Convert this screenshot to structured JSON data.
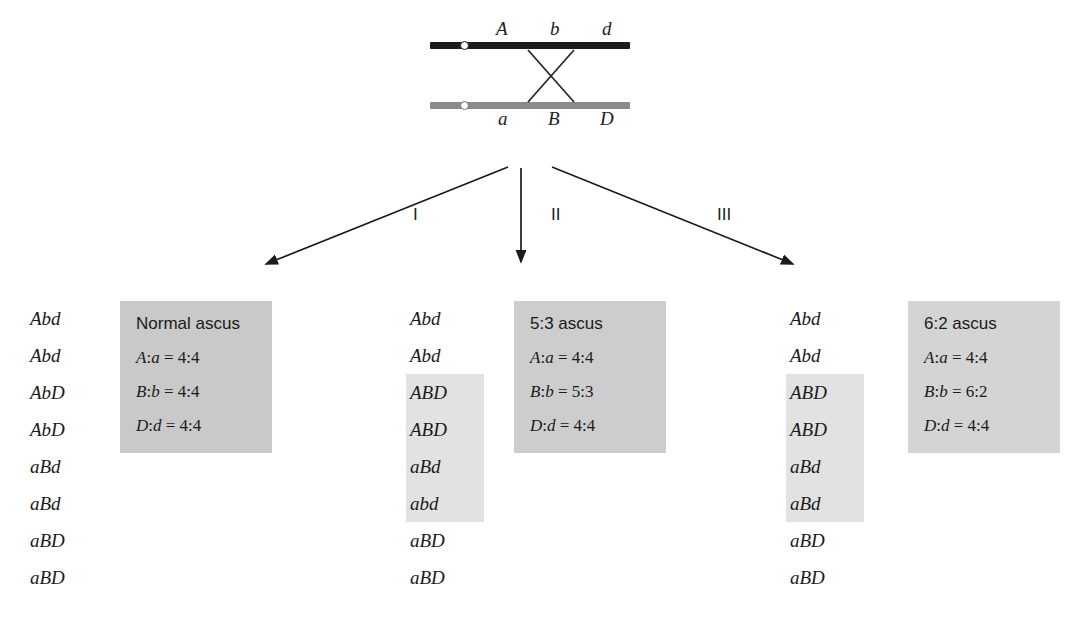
{
  "diagram": {
    "chromosomes": {
      "top": {
        "name": "top-chromatid",
        "color": "#1c1c1c",
        "alleles": [
          "A",
          "b",
          "d"
        ]
      },
      "bottom": {
        "name": "bottom-chromatid",
        "color": "#8a8a8a",
        "alleles": [
          "a",
          "B",
          "D"
        ]
      }
    },
    "crossover_label": "crossover-x"
  },
  "arrows": {
    "labels": [
      "I",
      "II",
      "III"
    ]
  },
  "columns": [
    {
      "id": "column-1",
      "genotypes": [
        {
          "text": "Abd",
          "highlight": false
        },
        {
          "text": "Abd",
          "highlight": false
        },
        {
          "text": "AbD",
          "highlight": false
        },
        {
          "text": "AbD",
          "highlight": false
        },
        {
          "text": "aBd",
          "highlight": false
        },
        {
          "text": "aBd",
          "highlight": false
        },
        {
          "text": "aBD",
          "highlight": false
        },
        {
          "text": "aBD",
          "highlight": false
        }
      ],
      "box": {
        "title": "Normal ascus",
        "ratios": [
          {
            "gene": "A",
            "allele": "a",
            "value": "4:4"
          },
          {
            "gene": "B",
            "allele": "b",
            "value": "4:4"
          },
          {
            "gene": "D",
            "allele": "d",
            "value": "4:4"
          }
        ]
      }
    },
    {
      "id": "column-2",
      "genotypes": [
        {
          "text": "Abd",
          "highlight": false
        },
        {
          "text": "Abd",
          "highlight": false
        },
        {
          "text": "ABD",
          "highlight": true
        },
        {
          "text": "ABD",
          "highlight": true
        },
        {
          "text": "aBd",
          "highlight": true
        },
        {
          "text": "abd",
          "highlight": true
        },
        {
          "text": "aBD",
          "highlight": false
        },
        {
          "text": "aBD",
          "highlight": false
        }
      ],
      "box": {
        "title": "5:3 ascus",
        "ratios": [
          {
            "gene": "A",
            "allele": "a",
            "value": "4:4"
          },
          {
            "gene": "B",
            "allele": "b",
            "value": "5:3"
          },
          {
            "gene": "D",
            "allele": "d",
            "value": "4:4"
          }
        ]
      }
    },
    {
      "id": "column-3",
      "genotypes": [
        {
          "text": "Abd",
          "highlight": false
        },
        {
          "text": "Abd",
          "highlight": false
        },
        {
          "text": "ABD",
          "highlight": true
        },
        {
          "text": "ABD",
          "highlight": true
        },
        {
          "text": "aBd",
          "highlight": true
        },
        {
          "text": "aBd",
          "highlight": true
        },
        {
          "text": "aBD",
          "highlight": false
        },
        {
          "text": "aBD",
          "highlight": false
        }
      ],
      "box": {
        "title": "6:2 ascus",
        "ratios": [
          {
            "gene": "A",
            "allele": "a",
            "value": "4:4"
          },
          {
            "gene": "B",
            "allele": "b",
            "value": "6:2"
          },
          {
            "gene": "D",
            "allele": "d",
            "value": "4:4"
          }
        ]
      }
    }
  ],
  "colors": {
    "box_fill": "#c9c9c9",
    "highlight_fill": "#e2e2e2",
    "chromatid_dark": "#1c1c1c",
    "chromatid_light": "#8a8a8a",
    "text": "#1a1a1a"
  }
}
